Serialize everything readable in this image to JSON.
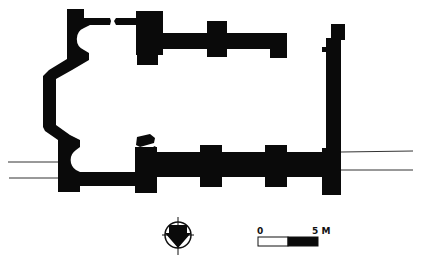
{
  "diagram": {
    "type": "architectural-floor-plan",
    "colors": {
      "walls": "#0a0a0a",
      "background": "#ffffff",
      "lines": "#333333"
    }
  },
  "north_arrow": {
    "icon": "north-arrow-icon",
    "direction": "down"
  },
  "scale_bar": {
    "start_label": "0",
    "end_label": "5 M",
    "segments": [
      "white",
      "black"
    ]
  }
}
